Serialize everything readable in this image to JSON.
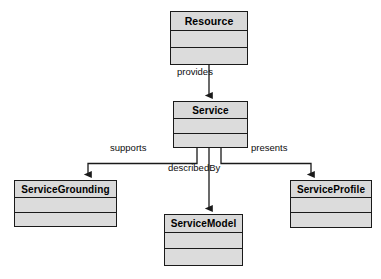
{
  "diagram": {
    "type": "uml-class-diagram",
    "background_color": "#ffffff",
    "line_color": "#1a1a1a",
    "box_fill_color": "#d9d9d9",
    "compartment_fill_color": "#dcdcdc",
    "classes": [
      {
        "id": "resource",
        "name": "Resource",
        "x": 170,
        "y": 11,
        "width": 78,
        "height": 54,
        "name_height": 19,
        "attr_height": 17
      },
      {
        "id": "service",
        "name": "Service",
        "x": 173,
        "y": 101,
        "width": 75,
        "height": 47,
        "name_height": 17,
        "attr_height": 15
      },
      {
        "id": "service_grounding",
        "name": "ServiceGrounding",
        "x": 14,
        "y": 180,
        "width": 103,
        "height": 47,
        "name_height": 17,
        "attr_height": 15
      },
      {
        "id": "service_model",
        "name": "ServiceModel",
        "x": 164,
        "y": 214,
        "width": 79,
        "height": 52,
        "name_height": 18,
        "attr_height": 16
      },
      {
        "id": "service_profile",
        "name": "ServiceProfile",
        "x": 290,
        "y": 180,
        "width": 82,
        "height": 48,
        "name_height": 17,
        "attr_height": 15
      }
    ],
    "edges": [
      {
        "id": "provides",
        "label": "provides",
        "from": "resource",
        "to": "service",
        "label_x": 177,
        "label_y": 66
      },
      {
        "id": "supports",
        "label": "supports",
        "from": "service",
        "to": "service_grounding",
        "label_x": 110,
        "label_y": 142
      },
      {
        "id": "describedBy",
        "label": "describedBy",
        "from": "service",
        "to": "service_model",
        "label_x": 168,
        "label_y": 162
      },
      {
        "id": "presents",
        "label": "presents",
        "from": "service",
        "to": "service_profile",
        "label_x": 251,
        "label_y": 142
      }
    ]
  }
}
